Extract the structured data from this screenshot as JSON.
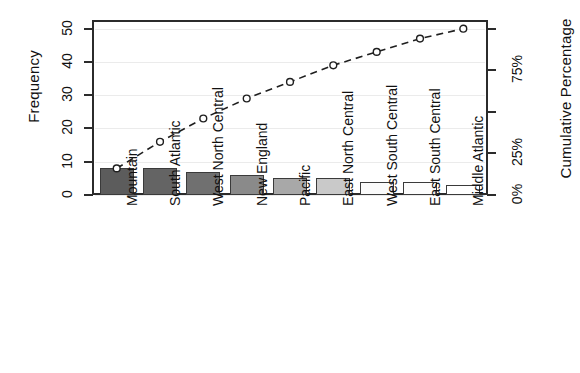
{
  "chart_data": {
    "type": "bar",
    "title": "",
    "subtitle": "",
    "xlabel": "",
    "ylabel": "Frequency",
    "y2label": "Cumulative Percentage",
    "categories": [
      "Mountain",
      "South Atlantic",
      "West North Central",
      "New England",
      "Pacific",
      "East North Central",
      "West South Central",
      "East South Central",
      "Middle Atlantic"
    ],
    "values": [
      8,
      8,
      7,
      6,
      5,
      5,
      4,
      4,
      3
    ],
    "cumulative": [
      8,
      16,
      23,
      29,
      34,
      39,
      43,
      47,
      50
    ],
    "cumulative_percent": [
      16,
      32,
      46,
      58,
      68,
      78,
      86,
      94,
      100
    ],
    "total": 50,
    "ylim": [
      0,
      52
    ],
    "yticks": [
      0,
      10,
      20,
      30,
      40,
      50
    ],
    "yticklabels": [
      "0",
      "10",
      "20",
      "30",
      "40",
      "50"
    ],
    "y2ticks": [
      0,
      25,
      50,
      75,
      100
    ],
    "y2ticklabels": [
      "0%",
      "25%",
      "",
      "75%",
      ""
    ],
    "grid": true,
    "legend": false,
    "bar_colors": [
      "#5c5c5c",
      "#646464",
      "#707070",
      "#8a8a8a",
      "#a8a8a8",
      "#c9c9c9",
      "#fafafa",
      "#fcfcfc",
      "#ffffff"
    ],
    "line_color": "#1f1f1f",
    "line_style": "dashed",
    "marker": "open-circle"
  }
}
